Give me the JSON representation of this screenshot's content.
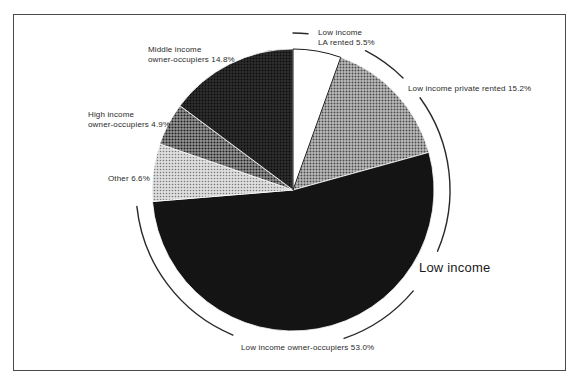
{
  "chart_data": {
    "type": "pie",
    "title": "",
    "slices": [
      {
        "id": "low-income-la-rented",
        "label": "Low income LA rented",
        "percent": 5.5,
        "lines": [
          "Low income",
          "LA rented 5.5%"
        ],
        "fill": "white-solid"
      },
      {
        "id": "low-income-private-rented",
        "label": "Low income private rented",
        "percent": 15.2,
        "lines": [
          "Low income private rented 15.2%"
        ],
        "fill": "halftone-mid"
      },
      {
        "id": "low-income-owner-occupiers",
        "label": "Low income owner-occupiers",
        "percent": 53.0,
        "lines": [
          "Low income owner-occupiers 53.0%"
        ],
        "fill": "black-solid"
      },
      {
        "id": "other",
        "label": "Other",
        "percent": 6.6,
        "lines": [
          "Other 6.6%"
        ],
        "fill": "halftone-light"
      },
      {
        "id": "high-income-owner-occupiers",
        "label": "High income owner-occupiers",
        "percent": 4.9,
        "lines": [
          "High income",
          "owner-occupiers 4.9%"
        ],
        "fill": "halftone-dark"
      },
      {
        "id": "middle-income-owner-occupiers",
        "label": "Middle income owner-occupiers",
        "percent": 14.8,
        "lines": [
          "Middle income",
          "owner-occupiers 14.8%"
        ],
        "fill": "halftone-darkest"
      }
    ],
    "group_annotation": {
      "label": "Low income",
      "covers": [
        "low-income-la-rented",
        "low-income-private-rented",
        "low-income-owner-occupiers"
      ],
      "total_percent": 73.7
    },
    "layout": {
      "start_angle_deg": 0,
      "direction": "clockwise",
      "center": [
        293,
        190
      ],
      "radius": 141,
      "group_arc": {
        "radius": 157,
        "segments": [
          [
            0,
            5.5
          ],
          [
            27.5,
            44.5
          ],
          [
            54,
            113
          ],
          [
            130,
            161
          ],
          [
            202.5,
            264
          ]
        ]
      }
    },
    "colors": {
      "ink": "#2a2a2a",
      "slice_black": "#141414",
      "halftone_mid": "#9b9b9b",
      "halftone_light": "#c9c9c9",
      "halftone_dark": "#777777",
      "halftone_darkest": "#262626",
      "background": "#ffffff"
    }
  }
}
